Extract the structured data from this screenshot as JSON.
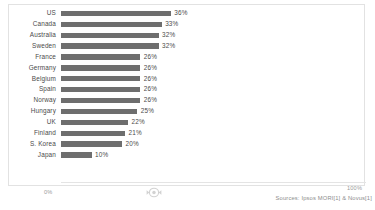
{
  "chart_data": {
    "type": "bar",
    "orientation": "horizontal",
    "title": "",
    "xlabel": "",
    "ylabel": "",
    "xlim": [
      0,
      100
    ],
    "grid": false,
    "legend": null,
    "categories": [
      "US",
      "Canada",
      "Australia",
      "Sweden",
      "France",
      "Germany",
      "Belgium",
      "Spain",
      "Norway",
      "Hungary",
      "UK",
      "Finland",
      "S. Korea",
      "Japan"
    ],
    "values": [
      36,
      33,
      32,
      32,
      26,
      26,
      26,
      26,
      26,
      25,
      22,
      21,
      20,
      10
    ],
    "value_labels": [
      "36%",
      "33%",
      "32%",
      "32%",
      "26%",
      "26%",
      "26%",
      "26%",
      "26%",
      "25%",
      "22%",
      "21%",
      "20%",
      "10%"
    ],
    "axis_ticks": [
      "0%",
      "100%"
    ],
    "bar_color": "#6e6e6e",
    "panel_border_color": "#e2e2e2",
    "label_color": "#4a4a4a",
    "axis_label_color": "#9a9a9a"
  },
  "footer": {
    "source": "Sources: Ipsos MORI[1] & Novus[1]"
  },
  "watermark": {
    "name": "circular-logo-watermark"
  }
}
